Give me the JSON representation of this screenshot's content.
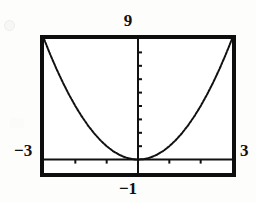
{
  "figure": {
    "kind": "graphing-calculator-window"
  },
  "window_labels": {
    "ymax": "9",
    "ymin": "−1",
    "xmin": "−3",
    "xmax": "3"
  },
  "colors": {
    "frame": "#0e0e0e",
    "curve": "#111111",
    "axis": "#111111",
    "screen_background": "#ffffff",
    "page_background": "#fdfdfc"
  },
  "chart_data": {
    "type": "line",
    "title": "",
    "xlabel": "",
    "ylabel": "",
    "xlim": [
      -3,
      3
    ],
    "ylim": [
      -1,
      9
    ],
    "grid": false,
    "legend": null,
    "x_tick_count": 6,
    "y_tick_count": 9,
    "x_tick_interval": 1,
    "y_tick_interval": 1,
    "axis_style": "cross-hair axes with tick marks, no gridlines",
    "curve_label": "y = x²",
    "vertex": [
      0,
      0
    ],
    "series": [
      {
        "name": "y = x^2",
        "x": [
          -3.0,
          -2.8,
          -2.6,
          -2.4,
          -2.2,
          -2.0,
          -1.8,
          -1.6,
          -1.4,
          -1.2,
          -1.0,
          -0.8,
          -0.6,
          -0.4,
          -0.2,
          0.0,
          0.2,
          0.4,
          0.6,
          0.8,
          1.0,
          1.2,
          1.4,
          1.6,
          1.8,
          2.0,
          2.2,
          2.4,
          2.6,
          2.8,
          3.0
        ],
        "y": [
          9.0,
          7.84,
          6.76,
          5.76,
          4.84,
          4.0,
          3.24,
          2.56,
          1.96,
          1.44,
          1.0,
          0.64,
          0.36,
          0.16,
          0.04,
          0.0,
          0.04,
          0.16,
          0.36,
          0.64,
          1.0,
          1.44,
          1.96,
          2.56,
          3.24,
          4.0,
          4.84,
          5.76,
          6.76,
          7.84,
          9.0
        ]
      }
    ]
  }
}
